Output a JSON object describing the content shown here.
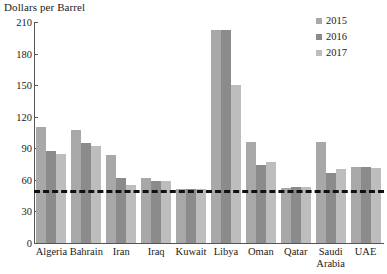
{
  "chart_data": {
    "type": "bar",
    "title": "Dollars per Barrel",
    "xlabel": "",
    "ylabel": "Dollars per Barrel",
    "ylim": [
      0,
      210
    ],
    "yticks": [
      0,
      30,
      60,
      90,
      120,
      150,
      180,
      210
    ],
    "grid": false,
    "legend_position": "top-right",
    "categories": [
      "Algeria",
      "Bahrain",
      "Iran",
      "Iraq",
      "Kuwait",
      "Libya",
      "Oman",
      "Qatar",
      "Saudi Arabia",
      "UAE"
    ],
    "series": [
      {
        "name": "2015",
        "color": "#a8a8a8",
        "values": [
          110,
          107,
          84,
          62,
          51,
          202,
          96,
          52,
          96,
          72
        ]
      },
      {
        "name": "2016",
        "color": "#8b8b8b",
        "values": [
          87,
          95,
          62,
          59,
          51,
          202,
          74,
          53,
          67,
          72
        ]
      },
      {
        "name": "2017",
        "color": "#bdbdbd",
        "values": [
          85,
          92,
          55,
          59,
          51,
          150,
          77,
          53,
          70,
          71
        ]
      }
    ],
    "annotations": [
      {
        "type": "hline",
        "label": "reference line",
        "value": 50,
        "style": "dashed",
        "color": "#111111"
      }
    ]
  },
  "legend": {
    "items": [
      {
        "label": "2015"
      },
      {
        "label": "2016"
      },
      {
        "label": "2017"
      }
    ]
  }
}
